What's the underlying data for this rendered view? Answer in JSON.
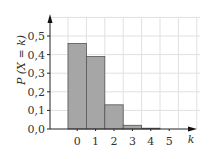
{
  "chart_data": {
    "type": "bar",
    "title": "",
    "xlabel": "k",
    "ylabel": "P (X = k)",
    "categories": [
      "0",
      "1",
      "2",
      "3",
      "4",
      "5"
    ],
    "values": [
      0.46,
      0.39,
      0.13,
      0.02,
      0.003,
      0.0
    ],
    "ylim": [
      0.0,
      0.55
    ],
    "yticks": [
      "0,0",
      "0,1",
      "0,2",
      "0,3",
      "0,4",
      "0,5"
    ],
    "grid": true,
    "legend": null,
    "bar_color": "#a6a6a6",
    "bar_edge_color": "#555555",
    "grid_color": "#e0e0e0",
    "axis_color": "#222222"
  }
}
